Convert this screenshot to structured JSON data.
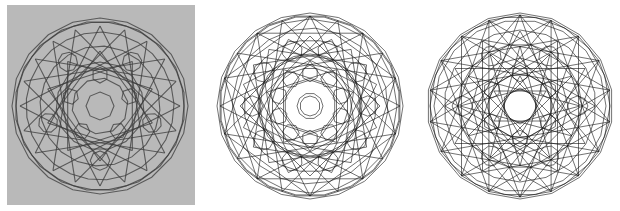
{
  "figure": {
    "panels": [
      {
        "id": "photo-model",
        "kind": "photograph",
        "description": "physical wireframe polyhedron model",
        "background": "#b9b9b9",
        "stroke": "#3a3a3a",
        "center": [
          93,
          101
        ],
        "radius": 88,
        "outline_sides": 20,
        "symmetry": 5,
        "rings": [
          {
            "r": 14,
            "sides": 8,
            "rot": 0
          },
          {
            "r": 28,
            "sides": 10,
            "rot": 9
          },
          {
            "r": 44,
            "sides": 15,
            "rot": 0
          },
          {
            "r": 60,
            "sides": 20,
            "rot": 4
          },
          {
            "r": 74,
            "sides": 25,
            "rot": 2
          },
          {
            "r": 84,
            "sides": 30,
            "rot": 6
          }
        ],
        "stars": [
          {
            "r": 55,
            "n": 10,
            "step": 3
          },
          {
            "r": 80,
            "n": 20,
            "step": 7
          }
        ]
      },
      {
        "id": "projection-a",
        "kind": "line-drawing",
        "description": "projection with central decagon",
        "background": "#ffffff",
        "stroke": "#111111",
        "center": [
          100,
          101
        ],
        "radius": 93,
        "outline_sides": 20,
        "symmetry": 10,
        "rings": [
          {
            "r": 10,
            "sides": 10,
            "rot": 0
          },
          {
            "r": 13,
            "sides": 10,
            "rot": 18
          },
          {
            "r": 26,
            "sides": 10,
            "rot": 0
          },
          {
            "r": 38,
            "sides": 20,
            "rot": 9
          },
          {
            "r": 52,
            "sides": 20,
            "rot": 0
          },
          {
            "r": 66,
            "sides": 20,
            "rot": 9
          },
          {
            "r": 78,
            "sides": 20,
            "rot": 4
          },
          {
            "r": 87,
            "sides": 20,
            "rot": 0
          },
          {
            "r": 91,
            "sides": 20,
            "rot": 9
          }
        ],
        "stars": [
          {
            "r": 45,
            "n": 10,
            "step": 3
          },
          {
            "r": 70,
            "n": 20,
            "step": 5
          },
          {
            "r": 90,
            "n": 20,
            "step": 7
          },
          {
            "r": 90,
            "n": 10,
            "step": 2
          }
        ]
      },
      {
        "id": "projection-b",
        "kind": "line-drawing",
        "description": "projection with central six-point star",
        "background": "#ffffff",
        "stroke": "#111111",
        "center": [
          102,
          101
        ],
        "radius": 93,
        "outline_sides": 18,
        "symmetry": 6,
        "rings": [
          {
            "r": 18,
            "sides": 6,
            "rot": 0
          },
          {
            "r": 32,
            "sides": 12,
            "rot": 15
          },
          {
            "r": 48,
            "sides": 12,
            "rot": 0
          },
          {
            "r": 62,
            "sides": 18,
            "rot": 10
          },
          {
            "r": 76,
            "sides": 18,
            "rot": 0
          },
          {
            "r": 86,
            "sides": 18,
            "rot": 10
          },
          {
            "r": 91,
            "sides": 18,
            "rot": 0
          }
        ],
        "stars": [
          {
            "r": 30,
            "n": 6,
            "step": 2
          },
          {
            "r": 60,
            "n": 12,
            "step": 5
          },
          {
            "r": 91,
            "n": 18,
            "step": 7
          },
          {
            "r": 91,
            "n": 18,
            "step": 5
          },
          {
            "r": 75,
            "n": 12,
            "step": 4
          }
        ]
      }
    ]
  }
}
